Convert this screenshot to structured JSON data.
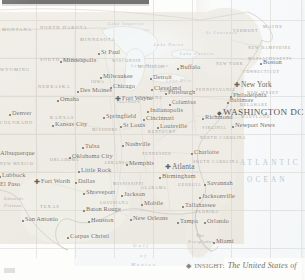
{
  "map": {
    "title": "The United States of America",
    "colors": {
      "land": "#ebe8e0",
      "ocean": "#f4f7f8",
      "boundary": "#c9c6bd",
      "city_label": "#4b4740",
      "state_label": "#8d8a80",
      "water_label": "#a9b9c3"
    },
    "cities": [
      {
        "name": "St Paul",
        "x": 101,
        "y": 52,
        "size": "reg",
        "marker": "dot"
      },
      {
        "name": "Minneapolis",
        "x": 63,
        "y": 60,
        "size": "reg",
        "marker": "dot"
      },
      {
        "name": "Milwaukee",
        "x": 103,
        "y": 76,
        "size": "reg",
        "marker": "dot"
      },
      {
        "name": "Chicago",
        "x": 113,
        "y": 86,
        "size": "reg",
        "marker": "dot"
      },
      {
        "name": "Des Moines",
        "x": 80,
        "y": 90,
        "size": "reg",
        "marker": "dot"
      },
      {
        "name": "Fort Wayne",
        "x": 122,
        "y": 98,
        "size": "reg",
        "marker": "star"
      },
      {
        "name": "Omaha",
        "x": 60,
        "y": 99,
        "size": "reg",
        "marker": "dot"
      },
      {
        "name": "Detroit",
        "x": 153,
        "y": 77,
        "size": "reg",
        "marker": "dot"
      },
      {
        "name": "Cleveland",
        "x": 154,
        "y": 88,
        "size": "reg",
        "marker": "dot"
      },
      {
        "name": "Buffalo",
        "x": 180,
        "y": 67,
        "size": "reg",
        "marker": "dot"
      },
      {
        "name": "Pittsburgh",
        "x": 168,
        "y": 92,
        "size": "reg",
        "marker": "dot"
      },
      {
        "name": "Columbus",
        "x": 172,
        "y": 103,
        "size": "sm",
        "marker": "dot"
      },
      {
        "name": "Indianapolis",
        "x": 150,
        "y": 110,
        "size": "reg",
        "marker": "dot"
      },
      {
        "name": "Cincinnati",
        "x": 146,
        "y": 118,
        "size": "reg",
        "marker": "dot"
      },
      {
        "name": "Springfield",
        "x": 106,
        "y": 116,
        "size": "reg",
        "marker": "dot"
      },
      {
        "name": "St Louis",
        "x": 123,
        "y": 125,
        "size": "reg",
        "marker": "dot"
      },
      {
        "name": "Louisville",
        "x": 160,
        "y": 126,
        "size": "reg",
        "marker": "dot"
      },
      {
        "name": "Kansas City",
        "x": 55,
        "y": 124,
        "size": "reg",
        "marker": "dot"
      },
      {
        "name": "Denver",
        "x": 12,
        "y": 113,
        "size": "reg",
        "marker": "dot"
      },
      {
        "name": "New York",
        "x": 241,
        "y": 84,
        "size": "big",
        "marker": "star"
      },
      {
        "name": "Philadelphia",
        "x": 233,
        "y": 95,
        "size": "reg",
        "marker": "dot"
      },
      {
        "name": "Baltimore",
        "x": 230,
        "y": 101,
        "size": "sm",
        "marker": "dot"
      },
      {
        "name": "WASHINGTON DC",
        "x": 223,
        "y": 111,
        "size": "cap",
        "marker": "diamond"
      },
      {
        "name": "Richmond",
        "x": 205,
        "y": 117,
        "size": "reg",
        "marker": "dot"
      },
      {
        "name": "Newport News",
        "x": 235,
        "y": 125,
        "size": "reg",
        "marker": "dot"
      },
      {
        "name": "Boston",
        "x": 263,
        "y": 62,
        "size": "reg",
        "marker": "dot"
      },
      {
        "name": "Nashville",
        "x": 125,
        "y": 144,
        "size": "reg",
        "marker": "dot"
      },
      {
        "name": "Tulsa",
        "x": 85,
        "y": 146,
        "size": "reg",
        "marker": "dot"
      },
      {
        "name": "Oklahoma City",
        "x": 72,
        "y": 156,
        "size": "reg",
        "marker": "dot"
      },
      {
        "name": "Memphis",
        "x": 129,
        "y": 163,
        "size": "reg",
        "marker": "dot"
      },
      {
        "name": "Little Rock",
        "x": 81,
        "y": 170,
        "size": "reg",
        "marker": "dot"
      },
      {
        "name": "Charlotte",
        "x": 194,
        "y": 152,
        "size": "reg",
        "marker": "dot"
      },
      {
        "name": "Atlanta",
        "x": 172,
        "y": 166,
        "size": "big",
        "marker": "star"
      },
      {
        "name": "Birmingham",
        "x": 162,
        "y": 176,
        "size": "reg",
        "marker": "dot"
      },
      {
        "name": "Savannah",
        "x": 207,
        "y": 183,
        "size": "reg",
        "marker": "dot"
      },
      {
        "name": "Jacksonville",
        "x": 202,
        "y": 196,
        "size": "reg",
        "marker": "dot"
      },
      {
        "name": "Tallahassee",
        "x": 185,
        "y": 205,
        "size": "reg",
        "marker": "dot"
      },
      {
        "name": "Mobile",
        "x": 144,
        "y": 203,
        "size": "reg",
        "marker": "dot"
      },
      {
        "name": "Jackson",
        "x": 124,
        "y": 194,
        "size": "reg",
        "marker": "dot"
      },
      {
        "name": "Shreveport",
        "x": 86,
        "y": 192,
        "size": "reg",
        "marker": "dot"
      },
      {
        "name": "Baton Rouge",
        "x": 86,
        "y": 209,
        "size": "reg",
        "marker": "dot"
      },
      {
        "name": "New Orleans",
        "x": 133,
        "y": 218,
        "size": "reg",
        "marker": "dot"
      },
      {
        "name": "Houston",
        "x": 91,
        "y": 220,
        "size": "reg",
        "marker": "dot"
      },
      {
        "name": "Dallas",
        "x": 78,
        "y": 181,
        "size": "reg",
        "marker": "dot"
      },
      {
        "name": "Fort Worth",
        "x": 41,
        "y": 181,
        "size": "reg",
        "marker": "star"
      },
      {
        "name": "San Antonio",
        "x": 25,
        "y": 219,
        "size": "reg",
        "marker": "dot"
      },
      {
        "name": "Corpus Christi",
        "x": 70,
        "y": 236,
        "size": "reg",
        "marker": "dot"
      },
      {
        "name": "Lubbock",
        "x": 2,
        "y": 175,
        "size": "reg",
        "marker": "dot"
      },
      {
        "name": "El Paso",
        "x": 0,
        "y": 184,
        "size": "reg",
        "marker": "dot"
      },
      {
        "name": "Albuquerque",
        "x": 0,
        "y": 153,
        "size": "reg",
        "marker": "dot"
      },
      {
        "name": "Tampa",
        "x": 180,
        "y": 221,
        "size": "reg",
        "marker": "dot"
      },
      {
        "name": "Orlando",
        "x": 207,
        "y": 221,
        "size": "reg",
        "marker": "dot"
      },
      {
        "name": "Miami",
        "x": 216,
        "y": 241,
        "size": "reg",
        "marker": "dot"
      }
    ],
    "states": [
      {
        "name": "MONTANA",
        "x": 2,
        "y": 28,
        "size": "reg"
      },
      {
        "name": "NORTH DAKOTA",
        "x": 40,
        "y": 26,
        "size": "reg"
      },
      {
        "name": "SOUTH DAKOTA",
        "x": 40,
        "y": 58,
        "size": "reg"
      },
      {
        "name": "WYOMING",
        "x": 0,
        "y": 68,
        "size": "reg"
      },
      {
        "name": "NEBRASKA",
        "x": 38,
        "y": 85,
        "size": "reg"
      },
      {
        "name": "MINNESOTA",
        "x": 80,
        "y": 38,
        "size": "reg"
      },
      {
        "name": "IOWA",
        "x": 91,
        "y": 81,
        "size": "sm"
      },
      {
        "name": "WISCONSIN",
        "x": 112,
        "y": 60,
        "size": "sm"
      },
      {
        "name": "MICHIGAN",
        "x": 138,
        "y": 66,
        "size": "sm"
      },
      {
        "name": "ILLINOIS",
        "x": 117,
        "y": 101,
        "size": "sm"
      },
      {
        "name": "INDIANA",
        "x": 140,
        "y": 97,
        "size": "sm"
      },
      {
        "name": "OHIO",
        "x": 160,
        "y": 90,
        "size": "sm"
      },
      {
        "name": "COLORADO",
        "x": 0,
        "y": 121,
        "size": "reg"
      },
      {
        "name": "KANSAS",
        "x": 50,
        "y": 116,
        "size": "reg"
      },
      {
        "name": "MISSOURI",
        "x": 92,
        "y": 129,
        "size": "sm"
      },
      {
        "name": "KENTUCKY",
        "x": 148,
        "y": 131,
        "size": "sm"
      },
      {
        "name": "PENNSYLVANIA",
        "x": 196,
        "y": 89,
        "size": "sm"
      },
      {
        "name": "NEW YORK",
        "x": 216,
        "y": 63,
        "size": "sm"
      },
      {
        "name": "VERMONT",
        "x": 233,
        "y": 30,
        "size": "sm"
      },
      {
        "name": "MAINE",
        "x": 263,
        "y": 25,
        "size": "reg"
      },
      {
        "name": "NEW HAMPSHIRE",
        "x": 248,
        "y": 47,
        "size": "sm"
      },
      {
        "name": "MASSACHUSETTS",
        "x": 248,
        "y": 58,
        "size": "sm"
      },
      {
        "name": "CONNECTICUT",
        "x": 243,
        "y": 71,
        "size": "sm"
      },
      {
        "name": "NEW JERSEY",
        "x": 247,
        "y": 92,
        "size": "sm"
      },
      {
        "name": "DELAWARE",
        "x": 240,
        "y": 104,
        "size": "sm"
      },
      {
        "name": "MARYLAND",
        "x": 241,
        "y": 116,
        "size": "sm"
      },
      {
        "name": "VIRGINIA",
        "x": 202,
        "y": 127,
        "size": "sm"
      },
      {
        "name": "NORTH CAROLINA",
        "x": 200,
        "y": 137,
        "size": "sm"
      },
      {
        "name": "SOUTH CAROLINA",
        "x": 193,
        "y": 161,
        "size": "sm"
      },
      {
        "name": "TENNESSEE",
        "x": 142,
        "y": 153,
        "size": "sm"
      },
      {
        "name": "OKLAHOMA",
        "x": 50,
        "y": 159,
        "size": "sm"
      },
      {
        "name": "ARKANSAS",
        "x": 104,
        "y": 162,
        "size": "sm"
      },
      {
        "name": "MISSISSIPPI",
        "x": 113,
        "y": 183,
        "size": "sm"
      },
      {
        "name": "ALABAMA",
        "x": 141,
        "y": 187,
        "size": "sm"
      },
      {
        "name": "GEORGIA",
        "x": 178,
        "y": 184,
        "size": "sm"
      },
      {
        "name": "LOUISIANA",
        "x": 100,
        "y": 202,
        "size": "sm"
      },
      {
        "name": "TEXAS",
        "x": 40,
        "y": 205,
        "size": "reg"
      },
      {
        "name": "NEW MEXICO",
        "x": 0,
        "y": 163,
        "size": "sm"
      },
      {
        "name": "FLORIDA",
        "x": 196,
        "y": 211,
        "size": "sm"
      }
    ],
    "water_labels": [
      {
        "name": "ATLANTIC",
        "x": 240,
        "y": 160,
        "size": "big"
      },
      {
        "name": "OCEAN",
        "x": 247,
        "y": 177,
        "size": "big"
      },
      {
        "name": "Gulf",
        "x": 133,
        "y": 243,
        "size": "reg"
      },
      {
        "name": "of",
        "x": 140,
        "y": 253,
        "size": "reg"
      },
      {
        "name": "Mexico",
        "x": 131,
        "y": 262,
        "size": "reg"
      },
      {
        "name": "Lake Superior",
        "x": 108,
        "y": 22,
        "size": "sm"
      },
      {
        "name": "Lake Michigan",
        "x": 131,
        "y": 64,
        "size": "sm"
      },
      {
        "name": "Lake Huron",
        "x": 154,
        "y": 43,
        "size": "sm"
      },
      {
        "name": "Lake Erie",
        "x": 166,
        "y": 79,
        "size": "sm"
      },
      {
        "name": "Lake Ontario",
        "x": 180,
        "y": 52,
        "size": "sm"
      },
      {
        "name": "St Lawrence",
        "x": 206,
        "y": 31,
        "size": "sm"
      }
    ],
    "physical_labels": [
      {
        "name": "Edwards",
        "x": 4,
        "y": 197
      },
      {
        "name": "Plateau",
        "x": 4,
        "y": 204
      },
      {
        "name": "The",
        "x": 196,
        "y": 234
      },
      {
        "name": "Everglades",
        "x": 188,
        "y": 240
      }
    ]
  },
  "caption": {
    "diamond": "◆",
    "key": "Insight:",
    "text": "The United States of"
  },
  "corner": {
    "note": ""
  }
}
